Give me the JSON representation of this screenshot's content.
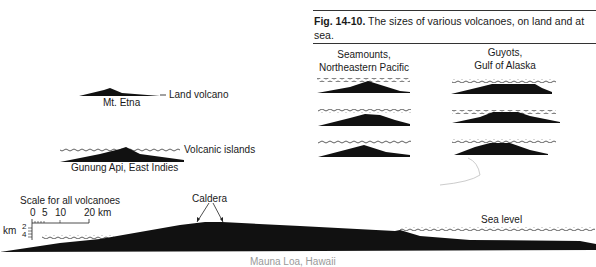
{
  "figure": {
    "number": "Fig. 14-10.",
    "caption": "The sizes of various volcanoes, on land and at sea."
  },
  "groups": {
    "seamounts": {
      "line1": "Seamounts,",
      "line2": "Northeastern Pacific"
    },
    "guyots": {
      "line1": "Guyots,",
      "line2": "Gulf of Alaska"
    }
  },
  "labels": {
    "etna": "Mt. Etna",
    "land_volcano": "Land volcano",
    "volcanic_islands": "Volcanic islands",
    "gunung_api": "Gunung Api, East Indies",
    "caldera": "Caldera",
    "sea_level": "Sea level",
    "mauna_loa": "Mauna Loa, Hawaii"
  },
  "scale": {
    "title": "Scale for all volcanoes",
    "horizontal_ticks": [
      "0",
      "5",
      "10",
      "20 km"
    ],
    "vertical_unit": "km",
    "vertical_ticks": [
      "2",
      "4"
    ]
  },
  "colors": {
    "ink": "#111111",
    "background": "#ffffff"
  }
}
